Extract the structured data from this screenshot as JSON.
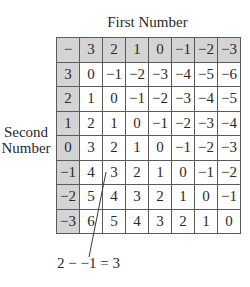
{
  "title": "First Number",
  "row_label_line1": "Second",
  "row_label_line2": "Number",
  "table": {
    "corner": "−",
    "column_headers": [
      "3",
      "2",
      "1",
      "0",
      "−1",
      "−2",
      "−3"
    ],
    "rows": [
      {
        "header": "3",
        "cells": [
          "0",
          "−1",
          "−2",
          "−3",
          "−4",
          "−5",
          "−6"
        ]
      },
      {
        "header": "2",
        "cells": [
          "1",
          "0",
          "−1",
          "−2",
          "−3",
          "−4",
          "−5"
        ]
      },
      {
        "header": "1",
        "cells": [
          "2",
          "1",
          "0",
          "−1",
          "−2",
          "−3",
          "−4"
        ]
      },
      {
        "header": "0",
        "cells": [
          "3",
          "2",
          "1",
          "0",
          "−1",
          "−2",
          "−3"
        ]
      },
      {
        "header": "−1",
        "cells": [
          "4",
          "3",
          "2",
          "1",
          "0",
          "−1",
          "−2"
        ]
      },
      {
        "header": "−2",
        "cells": [
          "5",
          "4",
          "3",
          "2",
          "1",
          "0",
          "−1"
        ]
      },
      {
        "header": "−3",
        "cells": [
          "6",
          "5",
          "4",
          "3",
          "2",
          "1",
          "0"
        ]
      }
    ]
  },
  "annotation": "2 − −1 = 3",
  "colors": {
    "header_fill": "#d4d4d4",
    "grid_line": "#5a5a5a",
    "text": "#2a2a2a"
  }
}
